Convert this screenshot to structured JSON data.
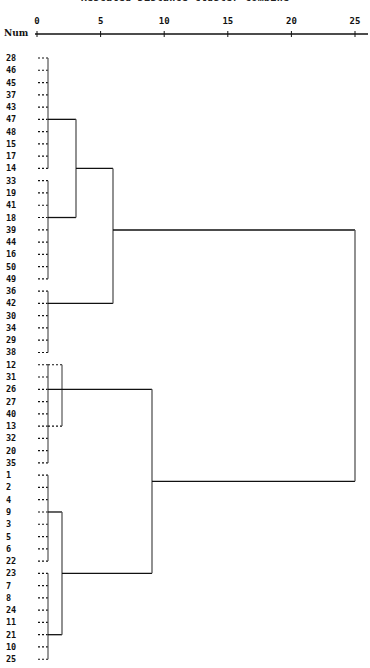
{
  "chart_data": {
    "type": "dendrogram",
    "title": "Rescaled Distance Cluster Combine",
    "axis_label": "Num",
    "x_ticks": [
      0,
      5,
      10,
      15,
      20,
      25
    ],
    "xlim": [
      0,
      25
    ],
    "leaf_order": [
      "28",
      "46",
      "45",
      "37",
      "43",
      "47",
      "48",
      "15",
      "17",
      "14",
      "33",
      "19",
      "41",
      "18",
      "39",
      "44",
      "16",
      "50",
      "49",
      "36",
      "42",
      "30",
      "34",
      "29",
      "38",
      "12",
      "31",
      "26",
      "27",
      "40",
      "13",
      "32",
      "20",
      "35",
      "1",
      "2",
      "4",
      "9",
      "3",
      "5",
      "6",
      "22",
      "23",
      "7",
      "8",
      "24",
      "11",
      "21",
      "10",
      "25"
    ],
    "clusters": [
      {
        "name": "A",
        "members": [
          "28",
          "46",
          "45",
          "37",
          "43",
          "47",
          "48",
          "15",
          "17",
          "14"
        ],
        "join_distance": 0.9
      },
      {
        "name": "B",
        "members": [
          "33",
          "19",
          "41",
          "18",
          "39",
          "44",
          "16",
          "50",
          "49"
        ],
        "join_distance": 0.9
      },
      {
        "name": "C",
        "members": [
          "36",
          "42",
          "30",
          "34",
          "29",
          "38"
        ],
        "join_distance": 0.9
      },
      {
        "name": "D",
        "members": [
          "12",
          "31",
          "26",
          "27",
          "40",
          "13",
          "32",
          "20",
          "35"
        ],
        "join_distance": 0.9,
        "sub_bracket": {
          "members_from": "12",
          "members_to": "13",
          "distance": 2.0
        }
      },
      {
        "name": "E",
        "members": [
          "1",
          "2",
          "4",
          "9",
          "3",
          "5",
          "6",
          "22"
        ],
        "join_distance": 0.9
      },
      {
        "name": "F",
        "members": [
          "23",
          "7",
          "8",
          "24",
          "11",
          "21",
          "10",
          "25"
        ],
        "join_distance": 0.9
      }
    ],
    "merges": [
      {
        "left": "A",
        "right": "B",
        "distance": 3.0
      },
      {
        "left": "A+B",
        "right": "C",
        "distance": 5.9
      },
      {
        "left": "E",
        "right": "F",
        "distance": 2.0
      },
      {
        "left": "D",
        "right": "E+F",
        "distance": 9.0
      },
      {
        "left": "A+B+C",
        "right": "D+E+F",
        "distance": 25.0
      }
    ]
  },
  "labels": {
    "title": "Rescaled Distance Cluster Combine",
    "axis": "Num"
  }
}
